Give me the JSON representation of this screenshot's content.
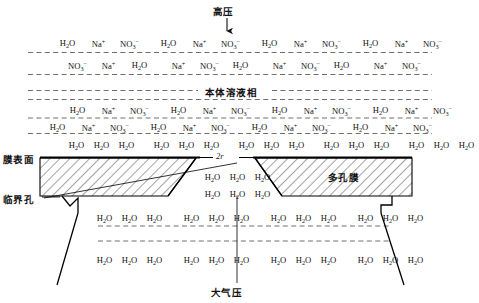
{
  "diagram": {
    "title_top": "高压",
    "title_bottom": "大气压",
    "label_membrane_surface": "膜表面",
    "label_critical_pore": "临界孔",
    "label_porous_membrane": "多孔膜",
    "label_bulk_solution": "本体溶液相",
    "label_pore_diameter": "2r",
    "species": {
      "water": "H₂O",
      "sodium": "Na⁺",
      "nitrate": "NO₃⁻"
    }
  },
  "solution_rows": [
    {
      "id": "row-1",
      "y": 38,
      "cells": [
        "H2O",
        "Na",
        "NO3",
        "H2O",
        "Na",
        "NO3",
        "H2O",
        "Na",
        "NO3",
        "H2O",
        "Na",
        "NO3"
      ]
    },
    {
      "id": "row-2",
      "y": 60,
      "cells": [
        "NO3",
        "Na",
        "H2O",
        "Na",
        "NO3",
        "H2O",
        "Na",
        "NO3",
        "H2O",
        "Na",
        "NO3"
      ]
    },
    {
      "id": "row-3",
      "y": 105,
      "cells": [
        "H2O",
        "Na",
        "NO3",
        "H2O",
        "Na",
        "NO3",
        "H2O",
        "Na",
        "NO3",
        "H2O",
        "Na",
        "NO3"
      ]
    },
    {
      "id": "row-4",
      "y": 122,
      "cells": [
        "H2O",
        "Na",
        "NO3",
        "H2O",
        "Na",
        "NO3",
        "H2O",
        "Na",
        "NO3",
        "H2O",
        "Na",
        "NO3"
      ]
    }
  ],
  "water_rows": [
    {
      "id": "water-row-top",
      "y": 140,
      "groups": 5,
      "per_group": 3
    },
    {
      "id": "water-row-pore-1",
      "y": 172,
      "groups": 1,
      "per_group": 3
    },
    {
      "id": "water-row-pore-2",
      "y": 189,
      "groups": 1,
      "per_group": 3
    },
    {
      "id": "water-row-lower-1",
      "y": 213,
      "groups": 4,
      "per_group": 3
    },
    {
      "id": "water-row-lower-2",
      "y": 255,
      "groups": 4,
      "per_group": 3
    }
  ],
  "colors": {
    "line": "#000000",
    "dash": "#555555",
    "hatch": "#333333",
    "text": "#111111"
  }
}
